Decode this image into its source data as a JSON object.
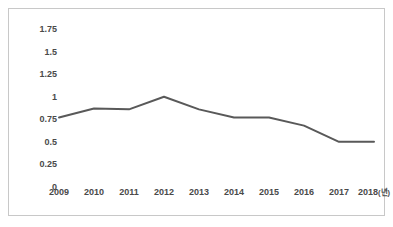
{
  "chart_data": {
    "type": "line",
    "title": "",
    "subtitle": "",
    "xlabel": "",
    "ylabel": "",
    "x_unit_suffix": "(년)",
    "categories": [
      "2009",
      "2010",
      "2011",
      "2012",
      "2013",
      "2014",
      "2015",
      "2016",
      "2017",
      "2018"
    ],
    "x_tick_labels": [
      "2009",
      "2010",
      "2011",
      "2012",
      "2013",
      "2014",
      "2015",
      "2016",
      "2017",
      "2018(년)"
    ],
    "values": [
      0.77,
      0.87,
      0.86,
      1.0,
      0.86,
      0.77,
      0.77,
      0.68,
      0.5,
      0.5
    ],
    "series": [
      {
        "name": "",
        "values": [
          0.77,
          0.87,
          0.86,
          1.0,
          0.86,
          0.77,
          0.77,
          0.68,
          0.5,
          0.5
        ]
      }
    ],
    "ylim": [
      0,
      1.75
    ],
    "y_ticks": [
      0,
      0.25,
      0.5,
      0.75,
      1,
      1.25,
      1.5,
      1.75
    ],
    "y_tick_labels": [
      "0",
      "0.25",
      "0.5",
      "0.75",
      "1",
      "1.25",
      "1.5",
      "1.75"
    ],
    "grid": false,
    "legend": false,
    "legend_position": "none",
    "annotations": [],
    "line_color": "#595959",
    "line_width": 2,
    "markers": false,
    "plot_background": "#ffffff",
    "frame_color": "#c8c8c8",
    "tick_label_color": "#4a4a4a"
  }
}
